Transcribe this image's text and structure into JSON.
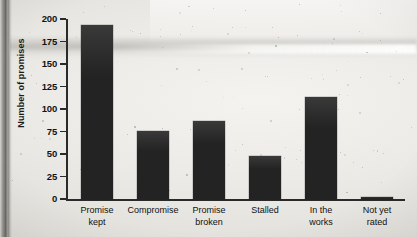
{
  "chart_data": {
    "type": "bar",
    "title": "",
    "xlabel": "",
    "ylabel": "Number of promises",
    "categories": [
      "Promise kept",
      "Compromise",
      "Promise broken",
      "Stalled",
      "In the works",
      "Not yet rated"
    ],
    "category_lines": [
      [
        "Promise",
        "kept"
      ],
      [
        "Compromise"
      ],
      [
        "Promise",
        "broken"
      ],
      [
        "Stalled"
      ],
      [
        "In the",
        "works"
      ],
      [
        "Not yet",
        "rated"
      ]
    ],
    "values": [
      193,
      76,
      87,
      48,
      113,
      2
    ],
    "ylim": [
      0,
      200
    ],
    "ytick_labels": [
      "200",
      "175",
      "150",
      "125",
      "100",
      "75",
      "50",
      "25",
      "0"
    ],
    "ytick_values": [
      200,
      175,
      150,
      125,
      100,
      75,
      50,
      25,
      0
    ],
    "grid": false,
    "legend": null,
    "bar_color": "#232323",
    "axis_color": "#2a2a2a"
  }
}
